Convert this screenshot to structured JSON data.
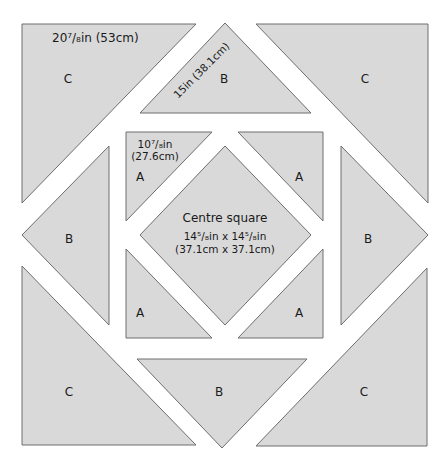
{
  "diagram": {
    "fill_color": "#d9d9d9",
    "stroke_color": "#6e6e6e",
    "pieces": [
      {
        "id": "c-top-left",
        "label": "C",
        "dimension": "20⁷/₈in (53cm)"
      },
      {
        "id": "b-top",
        "label": "B",
        "dimension": "15in (38.1cm)"
      },
      {
        "id": "c-top-right",
        "label": "C"
      },
      {
        "id": "a-top-left",
        "label": "A",
        "dimension_line1": "10⁷/₈in",
        "dimension_line2": "(27.6cm)"
      },
      {
        "id": "a-top-right",
        "label": "A"
      },
      {
        "id": "b-left",
        "label": "B"
      },
      {
        "id": "centre",
        "label": "Centre square",
        "dimension_line1": "14⁵/₈in x 14⁵/₈in",
        "dimension_line2": "(37.1cm x 37.1cm)"
      },
      {
        "id": "b-right",
        "label": "B"
      },
      {
        "id": "a-bottom-left",
        "label": "A"
      },
      {
        "id": "a-bottom-right",
        "label": "A"
      },
      {
        "id": "c-bottom-left",
        "label": "C"
      },
      {
        "id": "b-bottom",
        "label": "B"
      },
      {
        "id": "c-bottom-right",
        "label": "C"
      }
    ]
  }
}
